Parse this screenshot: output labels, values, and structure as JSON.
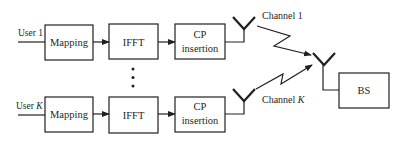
{
  "diagram": {
    "users": [
      {
        "label_prefix": "User ",
        "label_index": "1",
        "blocks": [
          "Mapping",
          "IFFT",
          "CP",
          "insertion"
        ],
        "channel_prefix": "Channel ",
        "channel_index": "1"
      },
      {
        "label_prefix": "User ",
        "label_index": "K",
        "blocks": [
          "Mapping",
          "IFFT",
          "CP",
          "insertion"
        ],
        "channel_prefix": "Channel ",
        "channel_index": "K"
      }
    ],
    "ellipsis": "⋮",
    "receiver": {
      "label": "BS"
    },
    "colors": {
      "stroke": "#231f20",
      "background": "#ffffff"
    }
  }
}
